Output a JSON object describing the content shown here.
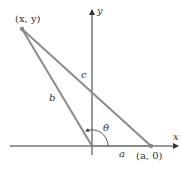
{
  "diagram": {
    "type": "triangle-on-axes",
    "axes": {
      "x_label": "x",
      "y_label": "y"
    },
    "points": {
      "top_left": "(x, y)",
      "x_intercept": "(a, 0)"
    },
    "sides": {
      "b": "b",
      "c": "c",
      "a": "a"
    },
    "angle": "θ",
    "colors": {
      "triangle": "#8a8a8a",
      "axes": "#333333",
      "points": "#888888"
    }
  }
}
